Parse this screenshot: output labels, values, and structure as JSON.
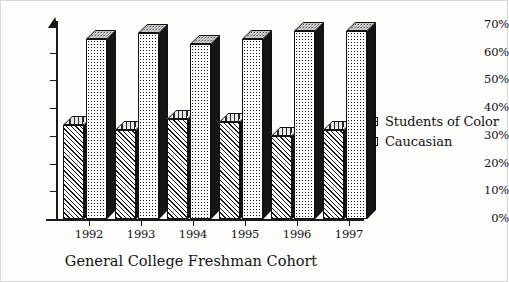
{
  "chart_data": {
    "type": "bar",
    "title": "",
    "xlabel": "General College Freshman Cohort",
    "ylabel": "",
    "categories": [
      "1992",
      "1993",
      "1994",
      "1995",
      "1996",
      "1997"
    ],
    "series": [
      {
        "name": "Students of Color",
        "values": [
          34,
          32,
          36,
          35,
          30,
          32
        ],
        "pattern": "diagonal-hatch"
      },
      {
        "name": "Caucasian",
        "values": [
          65,
          67,
          63,
          65,
          68,
          68
        ],
        "pattern": "dotted"
      }
    ],
    "ylim": [
      0,
      70
    ],
    "ytick_values": [
      70,
      60,
      50,
      40,
      30,
      20,
      10,
      0
    ],
    "ytick_labels": [
      "70%",
      "60%",
      "50%",
      "40%",
      "30%",
      "20%",
      "10%",
      "0%"
    ],
    "grid": false,
    "legend_position": "right",
    "style": "3d-bars-monochrome"
  },
  "legend": {
    "items": [
      {
        "label": "Students of Color",
        "swatch": "hatch-swatch-icon"
      },
      {
        "label": "Caucasian",
        "swatch": "dot-swatch-icon"
      }
    ]
  },
  "colors": {
    "ink": "#111111",
    "bar_side": "#151515",
    "paper": "#fdfdfc"
  }
}
